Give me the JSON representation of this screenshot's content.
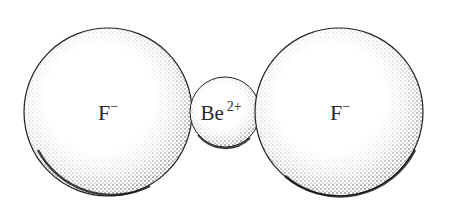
{
  "diagram": {
    "type": "ionic-structure",
    "ions": [
      {
        "id": "fluoride-left",
        "symbol": "F",
        "charge": "−",
        "cx": 108,
        "cy": 112,
        "r": 84
      },
      {
        "id": "beryllium",
        "symbol": "Be",
        "charge": "2+",
        "cx": 225,
        "cy": 112,
        "r": 35
      },
      {
        "id": "fluoride-right",
        "symbol": "F",
        "charge": "−",
        "cx": 339,
        "cy": 112,
        "r": 84
      }
    ],
    "colors": {
      "background": "#ffffff",
      "ink": "#1a1a1a"
    }
  }
}
